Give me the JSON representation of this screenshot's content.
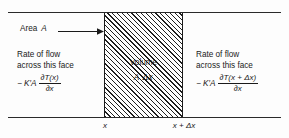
{
  "figure": {
    "background_color": "#fdfdfd",
    "line_color": "#2a2a2a"
  },
  "area": {
    "label": "Area",
    "symbol": "A",
    "arrow": "right-arrow"
  },
  "flow_left": {
    "line1": "Rate of flow",
    "line2": "across this face",
    "lead": "− K′A",
    "numerator": "∂T(x)",
    "denominator": "∂x"
  },
  "flow_right": {
    "line1": "Rate of flow",
    "line2": "across this face",
    "lead": "− K′A",
    "numerator": "∂T(x + Δx)",
    "denominator": "∂x"
  },
  "volume": {
    "label": "Volume",
    "expression": "A Δx"
  },
  "axis": {
    "tick_left": "x",
    "tick_right": "x + Δx"
  }
}
